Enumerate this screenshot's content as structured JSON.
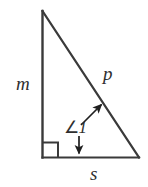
{
  "figure": {
    "type": "right-triangle-diagram",
    "background_color": "#ffffff",
    "stroke_color": "#3a3a3a",
    "text_color": "#2f2f2f",
    "stroke_width": 2,
    "vertices": {
      "apex": {
        "x": 42,
        "y": 11
      },
      "bottom_left": {
        "x": 42,
        "y": 157
      },
      "bottom_right": {
        "x": 139,
        "y": 157
      }
    },
    "sides": [
      {
        "name": "leg-vertical",
        "label": "m",
        "from": "apex",
        "to": "bottom_left"
      },
      {
        "name": "hypotenuse",
        "label": "p",
        "from": "apex",
        "to": "bottom_right"
      },
      {
        "name": "leg-horizontal",
        "label": "s",
        "from": "bottom_left",
        "to": "bottom_right"
      }
    ],
    "labels": {
      "m": "m",
      "p": "p",
      "s": "s",
      "angle_symbol": "∠",
      "angle_number": "1"
    },
    "right_angle_marker": {
      "name": "right-angle-square",
      "at": "bottom_left",
      "size": 15
    },
    "leaders": [
      {
        "name": "leader-to-hypotenuse",
        "from": {
          "x": 82,
          "y": 124
        },
        "to": {
          "x": 104,
          "y": 102
        },
        "arrowhead": "end"
      },
      {
        "name": "leader-to-base",
        "from": {
          "x": 79,
          "y": 136
        },
        "to": {
          "x": 79,
          "y": 157
        },
        "arrowhead": "end"
      }
    ]
  }
}
